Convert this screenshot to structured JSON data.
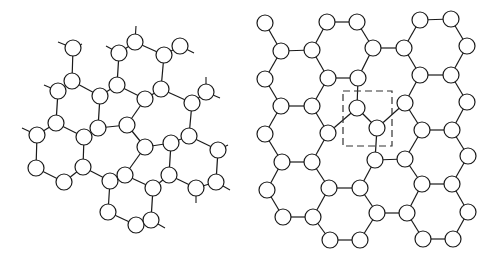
{
  "figure": {
    "panels": [
      {
        "id": "left",
        "title": "",
        "description": "Distorted carbon network with pentagon/heptagon rings and dangling bonds",
        "node_radius": 8,
        "nodes": [
          [
            73,
            48
          ],
          [
            72,
            81
          ],
          [
            58,
            91
          ],
          [
            100,
            96
          ],
          [
            117,
            85
          ],
          [
            119,
            53
          ],
          [
            135,
            42
          ],
          [
            164,
            55
          ],
          [
            180,
            46
          ],
          [
            161,
            89
          ],
          [
            145,
            99
          ],
          [
            192,
            103
          ],
          [
            206,
            92
          ],
          [
            56,
            123
          ],
          [
            37,
            135
          ],
          [
            84,
            137
          ],
          [
            98,
            128
          ],
          [
            127,
            125
          ],
          [
            145,
            147
          ],
          [
            171,
            143
          ],
          [
            189,
            136
          ],
          [
            218,
            150
          ],
          [
            36,
            168
          ],
          [
            64,
            182
          ],
          [
            83,
            167
          ],
          [
            110,
            181
          ],
          [
            125,
            175
          ],
          [
            153,
            188
          ],
          [
            169,
            175
          ],
          [
            196,
            188
          ],
          [
            216,
            182
          ],
          [
            108,
            212
          ],
          [
            136,
            225
          ],
          [
            151,
            220
          ]
        ],
        "edges": [
          [
            0,
            1
          ],
          [
            1,
            2
          ],
          [
            1,
            3
          ],
          [
            3,
            4
          ],
          [
            4,
            5
          ],
          [
            5,
            6
          ],
          [
            6,
            7
          ],
          [
            7,
            8
          ],
          [
            7,
            9
          ],
          [
            9,
            10
          ],
          [
            10,
            4
          ],
          [
            9,
            11
          ],
          [
            11,
            12
          ],
          [
            2,
            13
          ],
          [
            13,
            14
          ],
          [
            13,
            15
          ],
          [
            15,
            16
          ],
          [
            16,
            3
          ],
          [
            16,
            17
          ],
          [
            17,
            10
          ],
          [
            17,
            18
          ],
          [
            18,
            19
          ],
          [
            19,
            20
          ],
          [
            20,
            11
          ],
          [
            20,
            21
          ],
          [
            14,
            22
          ],
          [
            22,
            23
          ],
          [
            23,
            24
          ],
          [
            24,
            15
          ],
          [
            24,
            25
          ],
          [
            25,
            26
          ],
          [
            26,
            18
          ],
          [
            26,
            27
          ],
          [
            27,
            28
          ],
          [
            28,
            19
          ],
          [
            28,
            29
          ],
          [
            29,
            30
          ],
          [
            30,
            21
          ],
          [
            25,
            31
          ],
          [
            31,
            32
          ],
          [
            32,
            33
          ],
          [
            33,
            27
          ]
        ],
        "stubs": [
          [
            [
              73,
              48
            ],
            [
              58,
              42
            ]
          ],
          [
            [
              73,
              48
            ],
            [
              82,
              44
            ]
          ],
          [
            [
              58,
              91
            ],
            [
              44,
              85
            ]
          ],
          [
            [
              37,
              135
            ],
            [
              22,
              128
            ]
          ],
          [
            [
              119,
              53
            ],
            [
              106,
              46
            ]
          ],
          [
            [
              135,
              42
            ],
            [
              136,
              26
            ]
          ],
          [
            [
              180,
              46
            ],
            [
              194,
              53
            ]
          ],
          [
            [
              206,
              92
            ],
            [
              206,
              77
            ]
          ],
          [
            [
              206,
              92
            ],
            [
              220,
              98
            ]
          ],
          [
            [
              218,
              150
            ],
            [
              228,
              145
            ]
          ],
          [
            [
              196,
              188
            ],
            [
              196,
              203
            ]
          ],
          [
            [
              216,
              182
            ],
            [
              230,
              190
            ]
          ],
          [
            [
              151,
              220
            ],
            [
              165,
              228
            ]
          ]
        ]
      },
      {
        "id": "right",
        "title": "",
        "description": "Graphene lattice with a Stone-Wales-type defect highlighted by a dashed box",
        "node_radius": 8,
        "nodes": [
          [
            265,
            23
          ],
          [
            281,
            51
          ],
          [
            312,
            50
          ],
          [
            327,
            22
          ],
          [
            357,
            22
          ],
          [
            373,
            48
          ],
          [
            404,
            48
          ],
          [
            420,
            20
          ],
          [
            451,
            19
          ],
          [
            467,
            46
          ],
          [
            265,
            79
          ],
          [
            328,
            78
          ],
          [
            358,
            78
          ],
          [
            420,
            75
          ],
          [
            451,
            75
          ],
          [
            281,
            106
          ],
          [
            312,
            106
          ],
          [
            357,
            108
          ],
          [
            405,
            103
          ],
          [
            467,
            102
          ],
          [
            265,
            134
          ],
          [
            328,
            133
          ],
          [
            377,
            128
          ],
          [
            422,
            130
          ],
          [
            452,
            130
          ],
          [
            282,
            162
          ],
          [
            312,
            162
          ],
          [
            375,
            160
          ],
          [
            405,
            159
          ],
          [
            468,
            156
          ],
          [
            267,
            190
          ],
          [
            329,
            188
          ],
          [
            360,
            188
          ],
          [
            422,
            184
          ],
          [
            452,
            184
          ],
          [
            283,
            217
          ],
          [
            313,
            217
          ],
          [
            377,
            213
          ],
          [
            407,
            213
          ],
          [
            468,
            212
          ],
          [
            330,
            240
          ],
          [
            360,
            240
          ],
          [
            423,
            239
          ],
          [
            453,
            239
          ]
        ],
        "edges": [
          [
            0,
            1
          ],
          [
            1,
            2
          ],
          [
            2,
            3
          ],
          [
            3,
            4
          ],
          [
            4,
            5
          ],
          [
            5,
            6
          ],
          [
            6,
            7
          ],
          [
            7,
            8
          ],
          [
            8,
            9
          ],
          [
            1,
            10
          ],
          [
            2,
            11
          ],
          [
            11,
            12
          ],
          [
            12,
            5
          ],
          [
            6,
            13
          ],
          [
            13,
            14
          ],
          [
            14,
            9
          ],
          [
            10,
            15
          ],
          [
            15,
            16
          ],
          [
            16,
            11
          ],
          [
            12,
            17
          ],
          [
            13,
            18
          ],
          [
            14,
            19
          ],
          [
            15,
            20
          ],
          [
            16,
            21
          ],
          [
            17,
            21
          ],
          [
            17,
            22
          ],
          [
            22,
            18
          ],
          [
            18,
            23
          ],
          [
            23,
            24
          ],
          [
            24,
            19
          ],
          [
            20,
            25
          ],
          [
            25,
            26
          ],
          [
            26,
            21
          ],
          [
            22,
            27
          ],
          [
            27,
            28
          ],
          [
            28,
            23
          ],
          [
            24,
            29
          ],
          [
            25,
            30
          ],
          [
            26,
            31
          ],
          [
            31,
            32
          ],
          [
            32,
            27
          ],
          [
            28,
            33
          ],
          [
            33,
            34
          ],
          [
            34,
            29
          ],
          [
            30,
            35
          ],
          [
            35,
            36
          ],
          [
            36,
            31
          ],
          [
            32,
            37
          ],
          [
            37,
            38
          ],
          [
            38,
            33
          ],
          [
            34,
            39
          ],
          [
            36,
            40
          ],
          [
            40,
            41
          ],
          [
            41,
            37
          ],
          [
            38,
            42
          ],
          [
            42,
            43
          ],
          [
            43,
            39
          ]
        ],
        "defect_box": {
          "x": 343,
          "y": 91,
          "width": 49,
          "height": 55
        }
      }
    ]
  }
}
